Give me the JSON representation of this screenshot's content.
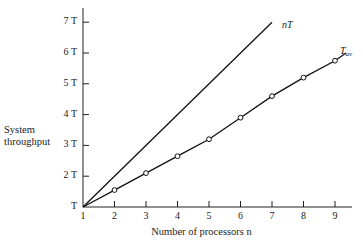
{
  "chart_data": {
    "type": "line",
    "title": "",
    "xlabel": "Number of processors n",
    "ylabel": "System throughput",
    "x": [
      1,
      2,
      3,
      4,
      5,
      6,
      7,
      8,
      9
    ],
    "x_tick_labels": [
      "1",
      "2",
      "3",
      "4",
      "5",
      "6",
      "7",
      "8",
      "9"
    ],
    "y_tick_labels": [
      "T",
      "2 T",
      "3 T",
      "4 T",
      "5 T",
      "6 T",
      "7 T"
    ],
    "y_tick_values": [
      1,
      2,
      3,
      4,
      5,
      6,
      7
    ],
    "xlim": [
      1,
      9.5
    ],
    "ylim": [
      1,
      7.5
    ],
    "grid": false,
    "series": [
      {
        "name": "nT",
        "label": "nT",
        "style": "line",
        "x": [
          1,
          7
        ],
        "values": [
          1,
          7
        ]
      },
      {
        "name": "T_av",
        "label": "T",
        "label_sub": "av",
        "style": "line-with-open-circle-markers",
        "x": [
          1,
          2,
          3,
          4,
          5,
          6,
          7,
          8,
          9
        ],
        "values": [
          1,
          1.55,
          2.1,
          2.65,
          3.2,
          3.9,
          4.6,
          5.2,
          5.75
        ],
        "end_value": 6.0
      }
    ]
  },
  "labels": {
    "ylabel_line1": "System",
    "ylabel_line2": "throughput",
    "xlabel": "Number of processors n",
    "series_nT": "nT",
    "series_tav_main": "T",
    "series_tav_sub": "av"
  }
}
